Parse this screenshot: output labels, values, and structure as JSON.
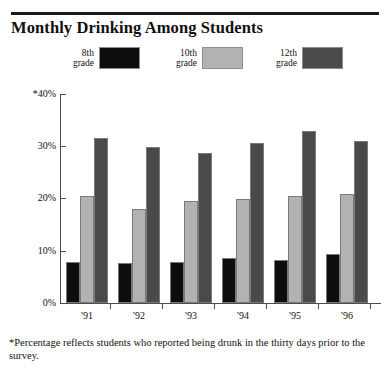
{
  "title": "Monthly Drinking Among Students",
  "footnote": "*Percentage reflects students who reported being drunk in the thirty days prior to the survey.",
  "legend": {
    "items": [
      {
        "label": "8th\ngrade",
        "color": "#0d0d0d"
      },
      {
        "label": "10th\ngrade",
        "color": "#b2b2b2"
      },
      {
        "label": "12th\ngrade",
        "color": "#4a4a4a"
      }
    ]
  },
  "axis": {
    "y_ticks": [
      "*40%",
      "30%",
      "20%",
      "10%",
      "0%"
    ],
    "x_ticks": [
      "'91",
      "'92",
      "'93",
      "'94",
      "'95",
      "'96"
    ]
  },
  "chart_data": {
    "type": "bar",
    "title": "Monthly Drinking Among Students",
    "xlabel": "",
    "ylabel": "",
    "ylim": [
      0,
      40
    ],
    "yticks": [
      0,
      10,
      20,
      30,
      40
    ],
    "ytick_labels": [
      "0%",
      "10%",
      "20%",
      "30%",
      "*40%"
    ],
    "grid": false,
    "legend_position": "top",
    "categories": [
      "'91",
      "'92",
      "'93",
      "'94",
      "'95",
      "'96"
    ],
    "series": [
      {
        "name": "8th grade",
        "color": "#0d0d0d",
        "values": [
          7.8,
          7.6,
          7.9,
          8.7,
          8.3,
          9.4
        ]
      },
      {
        "name": "10th grade",
        "color": "#b2b2b2",
        "values": [
          20.5,
          18.0,
          19.5,
          19.9,
          20.4,
          20.8
        ]
      },
      {
        "name": "12th grade",
        "color": "#4a4a4a",
        "values": [
          31.5,
          29.8,
          28.7,
          30.6,
          32.8,
          30.9
        ]
      }
    ],
    "annotations": [
      "*Percentage reflects students who reported being drunk in the thirty days prior to the survey."
    ]
  }
}
